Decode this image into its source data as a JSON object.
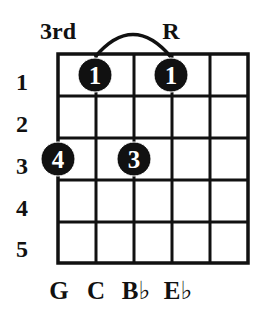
{
  "diagram": {
    "type": "chord-diagram",
    "top_labels": [
      {
        "text": "3rd",
        "x": 58
      },
      {
        "text": "R",
        "x": 171
      }
    ],
    "fret_numbers": [
      "1",
      "2",
      "3",
      "4",
      "5"
    ],
    "string_labels": [
      "G",
      "C",
      "B♭",
      "E♭"
    ],
    "grid": {
      "strings": 6,
      "frets": 5
    },
    "dots": [
      {
        "finger": "1",
        "string": 1,
        "fret": 1
      },
      {
        "finger": "1",
        "string": 3,
        "fret": 1
      },
      {
        "finger": "4",
        "string": 0,
        "fret": 3
      },
      {
        "finger": "3",
        "string": 2,
        "fret": 3
      }
    ],
    "arc": {
      "from_string": 1,
      "to_string": 3
    },
    "colors": {
      "ink": "#111111",
      "background": "#ffffff",
      "dot_text": "#ffffff"
    }
  }
}
